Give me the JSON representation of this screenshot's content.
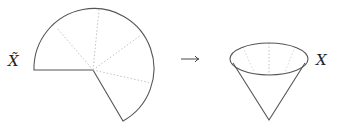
{
  "diagram": {
    "left_label": "X̃",
    "right_label": "X",
    "arrow": "⟶",
    "colors": {
      "stroke": "#555555",
      "dotted": "#bbbbbb",
      "text": "#222222"
    },
    "sector": {
      "center": [
        93,
        70
      ],
      "radius": 60,
      "dotted_rays": 4
    },
    "cone": {
      "ellipse_center": [
        269,
        59
      ],
      "rx": 39,
      "ry": 16,
      "apex": [
        269,
        120
      ]
    }
  }
}
